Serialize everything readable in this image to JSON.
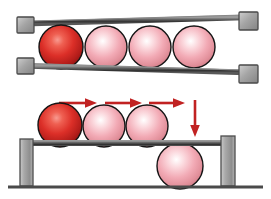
{
  "figure": {
    "background_color": "#ffffff",
    "width": 271,
    "height": 199
  },
  "palette": {
    "sphere_highlight_pink": "#ffffff",
    "sphere_mid_pink": "#f0a8b4",
    "sphere_edge_pink": "#d8868f",
    "sphere_highlight_red": "#f07070",
    "sphere_mid_red": "#d52b2b",
    "sphere_edge_red": "#8e1616",
    "sphere_outline": "#1a1a1a",
    "rail_dark": "#3a3a3a",
    "rail_light": "#8c8c8c",
    "post_fill": "#a8a8a8",
    "post_stroke": "#4a4a4a",
    "arrow_red": "#c12222",
    "ground_line": "#4a4a4a"
  },
  "upper_assembly": {
    "name": "upper-rail-track",
    "rails": [
      {
        "id": "upper-rail-top",
        "x1": 33,
        "y1": 23,
        "x2": 243,
        "y2": 17,
        "thickness": 5
      },
      {
        "id": "upper-rail-bottom",
        "x1": 33,
        "y1": 66,
        "x2": 243,
        "y2": 72,
        "thickness": 5
      }
    ],
    "end_caps": [
      {
        "id": "cap-top-left",
        "x": 17,
        "y": 17,
        "w": 17,
        "h": 16
      },
      {
        "id": "cap-top-right",
        "x": 239,
        "y": 12,
        "w": 19,
        "h": 18
      },
      {
        "id": "cap-bottom-left",
        "x": 17,
        "y": 58,
        "w": 17,
        "h": 16
      },
      {
        "id": "cap-bottom-right",
        "x": 239,
        "y": 65,
        "w": 19,
        "h": 18
      }
    ],
    "spheres": [
      {
        "id": "upper-sphere-1",
        "cx": 61,
        "cy": 47,
        "r": 22,
        "color": "red",
        "label": "leading ball"
      },
      {
        "id": "upper-sphere-2",
        "cx": 106,
        "cy": 47,
        "r": 21,
        "color": "pink",
        "label": "ball 2"
      },
      {
        "id": "upper-sphere-3",
        "cx": 150,
        "cy": 47,
        "r": 21,
        "color": "pink",
        "label": "ball 3"
      },
      {
        "id": "upper-sphere-4",
        "cx": 194,
        "cy": 47,
        "r": 21,
        "color": "pink",
        "label": "ball 4"
      }
    ]
  },
  "lower_assembly": {
    "name": "lower-shelf-track",
    "shelf": {
      "id": "lower-shelf-rail",
      "x": 29,
      "y": 141,
      "w": 194,
      "h": 5
    },
    "posts": [
      {
        "id": "post-left",
        "x": 20,
        "y": 139,
        "w": 13,
        "h": 47
      },
      {
        "id": "post-right",
        "x": 221,
        "y": 136,
        "w": 14,
        "h": 50
      }
    ],
    "ground": {
      "id": "ground-line",
      "x1": 8,
      "y1": 187,
      "x2": 263,
      "y2": 187,
      "thickness": 3
    },
    "spheres": [
      {
        "id": "lower-sphere-1",
        "cx": 60,
        "cy": 125,
        "r": 22,
        "color": "red",
        "label": "leading ball on shelf"
      },
      {
        "id": "lower-sphere-2",
        "cx": 104,
        "cy": 126,
        "r": 21,
        "color": "pink",
        "label": "ball 2 on shelf"
      },
      {
        "id": "lower-sphere-3",
        "cx": 147,
        "cy": 126,
        "r": 21,
        "color": "pink",
        "label": "ball 3 on shelf"
      },
      {
        "id": "lower-sphere-dropped",
        "cx": 180,
        "cy": 166,
        "r": 23,
        "color": "pink",
        "label": "dropped ball below shelf"
      }
    ]
  },
  "arrows": {
    "name": "motion-arrows",
    "horizontal": [
      {
        "id": "arrow-right-1",
        "x1": 60,
        "y1": 103,
        "x2": 96,
        "y2": 103,
        "direction": "right"
      },
      {
        "id": "arrow-right-2",
        "x1": 105,
        "y1": 103,
        "x2": 141,
        "y2": 103,
        "direction": "right"
      },
      {
        "id": "arrow-right-3",
        "x1": 148,
        "y1": 103,
        "x2": 184,
        "y2": 103,
        "direction": "right"
      }
    ],
    "vertical": [
      {
        "id": "arrow-down-1",
        "x1": 195,
        "y1": 100,
        "x2": 195,
        "y2": 136,
        "direction": "down"
      }
    ]
  }
}
